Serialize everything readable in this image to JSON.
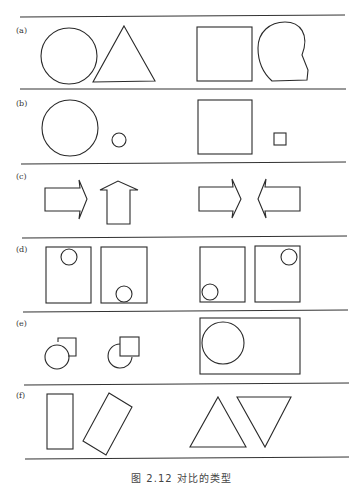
{
  "figure": {
    "caption": "图 2.12  对比的类型",
    "panels": [
      {
        "label": "(a)",
        "description": "shape contrast",
        "left": [
          "circle",
          "triangle"
        ],
        "right": [
          "square",
          "irregular-blob"
        ]
      },
      {
        "label": "(b)",
        "description": "size contrast",
        "left": [
          "large-circle",
          "small-circle"
        ],
        "right": [
          "large-square",
          "small-square"
        ]
      },
      {
        "label": "(c)",
        "description": "direction contrast",
        "left": [
          "right-arrow",
          "up-arrow"
        ],
        "right": [
          "right-arrow",
          "left-arrow"
        ]
      },
      {
        "label": "(d)",
        "description": "position contrast",
        "left": [
          "box-circle-top",
          "box-circle-bottom"
        ],
        "right": [
          "box-circle-bottom-left",
          "box-circle-top-right"
        ]
      },
      {
        "label": "(e)",
        "description": "overlap / figure-ground contrast",
        "left": [
          "circle-over-square",
          "square-over-circle"
        ],
        "right": [
          "circle-inside-rectangle"
        ]
      },
      {
        "label": "(f)",
        "description": "orientation contrast",
        "left": [
          "upright-rectangle",
          "tilted-rectangle"
        ],
        "right": [
          "upright-triangle",
          "inverted-triangle"
        ]
      }
    ]
  },
  "colors": {
    "stroke": "#2a2a2a",
    "background": "#ffffff"
  }
}
